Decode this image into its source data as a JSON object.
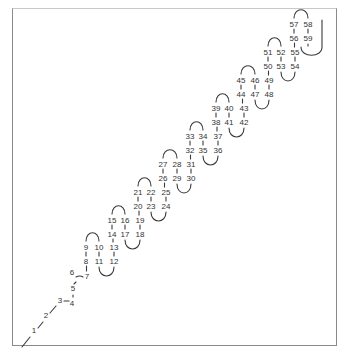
{
  "diagram": {
    "type": "hairpin-chain",
    "stroke_color": "#3a3a3a",
    "label_color": "#333333",
    "frame_color": "#8a8a8a",
    "labels": [
      {
        "n": "1",
        "x": 34,
        "y": 333
      },
      {
        "n": "2",
        "x": 46,
        "y": 318
      },
      {
        "n": "3",
        "x": 60,
        "y": 303
      },
      {
        "n": "4",
        "x": 72,
        "y": 306
      },
      {
        "n": "5",
        "x": 73,
        "y": 291
      },
      {
        "n": "6",
        "x": 72,
        "y": 275
      },
      {
        "n": "7",
        "x": 87,
        "y": 279
      },
      {
        "n": "8",
        "x": 86,
        "y": 264
      },
      {
        "n": "9",
        "x": 86,
        "y": 250
      },
      {
        "n": "10",
        "x": 99,
        "y": 250
      },
      {
        "n": "11",
        "x": 99,
        "y": 264
      },
      {
        "n": "12",
        "x": 114,
        "y": 264
      },
      {
        "n": "13",
        "x": 114,
        "y": 250
      },
      {
        "n": "14",
        "x": 112,
        "y": 237
      },
      {
        "n": "15",
        "x": 112,
        "y": 223
      },
      {
        "n": "16",
        "x": 125,
        "y": 223
      },
      {
        "n": "17",
        "x": 125,
        "y": 237
      },
      {
        "n": "18",
        "x": 140,
        "y": 237
      },
      {
        "n": "19",
        "x": 140,
        "y": 223
      },
      {
        "n": "20",
        "x": 138,
        "y": 209
      },
      {
        "n": "21",
        "x": 138,
        "y": 195
      },
      {
        "n": "22",
        "x": 151,
        "y": 195
      },
      {
        "n": "23",
        "x": 151,
        "y": 209
      },
      {
        "n": "24",
        "x": 166,
        "y": 209
      },
      {
        "n": "25",
        "x": 166,
        "y": 195
      },
      {
        "n": "26",
        "x": 163,
        "y": 181
      },
      {
        "n": "27",
        "x": 163,
        "y": 167
      },
      {
        "n": "28",
        "x": 177,
        "y": 167
      },
      {
        "n": "29",
        "x": 177,
        "y": 181
      },
      {
        "n": "30",
        "x": 191,
        "y": 181
      },
      {
        "n": "31",
        "x": 191,
        "y": 167
      },
      {
        "n": "32",
        "x": 190,
        "y": 153
      },
      {
        "n": "33",
        "x": 190,
        "y": 139
      },
      {
        "n": "34",
        "x": 203,
        "y": 139
      },
      {
        "n": "35",
        "x": 203,
        "y": 153
      },
      {
        "n": "36",
        "x": 218,
        "y": 153
      },
      {
        "n": "37",
        "x": 218,
        "y": 139
      },
      {
        "n": "38",
        "x": 216,
        "y": 125
      },
      {
        "n": "39",
        "x": 216,
        "y": 111
      },
      {
        "n": "40",
        "x": 229,
        "y": 111
      },
      {
        "n": "41",
        "x": 229,
        "y": 125
      },
      {
        "n": "42",
        "x": 244,
        "y": 125
      },
      {
        "n": "43",
        "x": 244,
        "y": 111
      },
      {
        "n": "44",
        "x": 241,
        "y": 97
      },
      {
        "n": "45",
        "x": 241,
        "y": 83
      },
      {
        "n": "46",
        "x": 255,
        "y": 83
      },
      {
        "n": "47",
        "x": 255,
        "y": 97
      },
      {
        "n": "48",
        "x": 269,
        "y": 97
      },
      {
        "n": "49",
        "x": 269,
        "y": 83
      },
      {
        "n": "50",
        "x": 268,
        "y": 69
      },
      {
        "n": "51",
        "x": 268,
        "y": 55
      },
      {
        "n": "52",
        "x": 281,
        "y": 55
      },
      {
        "n": "53",
        "x": 281,
        "y": 69
      },
      {
        "n": "54",
        "x": 295,
        "y": 69
      },
      {
        "n": "55",
        "x": 295,
        "y": 55
      },
      {
        "n": "56",
        "x": 294,
        "y": 41
      },
      {
        "n": "57",
        "x": 294,
        "y": 27
      },
      {
        "n": "58",
        "x": 308,
        "y": 27
      },
      {
        "n": "59",
        "x": 308,
        "y": 41
      }
    ]
  }
}
